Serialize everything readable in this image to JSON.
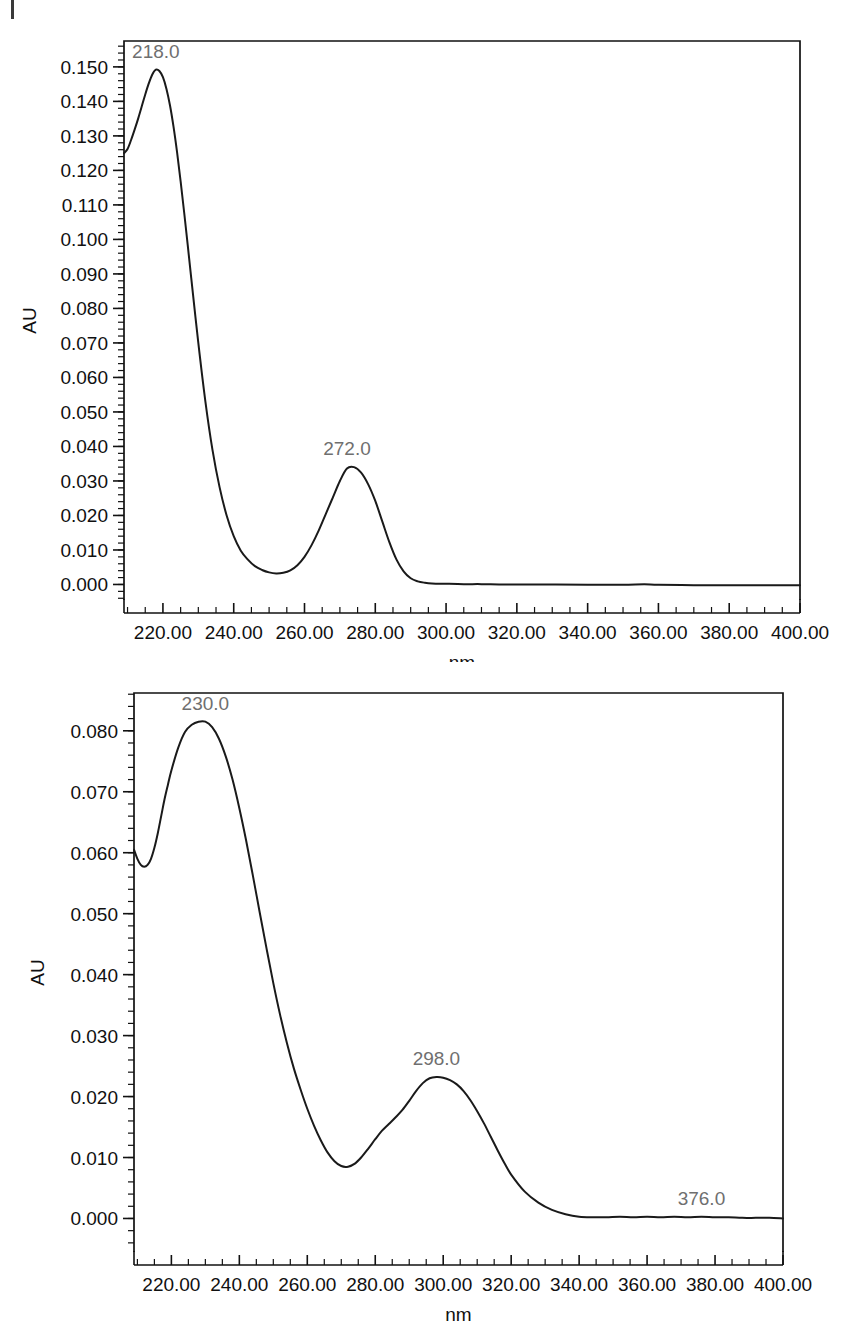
{
  "page": {
    "background_color": "#ffffff",
    "artifact_name": "scan-edge-mark",
    "width": 851,
    "height": 1324
  },
  "charts": [
    {
      "id": "uv-spectrum-top",
      "title": "",
      "xlabel": "nm",
      "ylabel": "AU",
      "trace_color": "#1a1a1a",
      "label_color": "#6f6f6f",
      "x_ticks": [
        "220.00",
        "240.00",
        "260.00",
        "280.00",
        "300.00",
        "320.00",
        "340.00",
        "360.00",
        "380.00",
        "400.00"
      ],
      "y_ticks": [
        "0.150",
        "0.140",
        "0.130",
        "0.120",
        "0.110",
        "0.100",
        "0.090",
        "0.080",
        "0.070",
        "0.060",
        "0.050",
        "0.040",
        "0.030",
        "0.020",
        "0.010",
        "0.000"
      ],
      "peaks": [
        {
          "label": "218.0",
          "nm": 218.0,
          "au": 0.1492
        },
        {
          "label": "272.0",
          "nm": 272.0,
          "au": 0.034
        }
      ]
    },
    {
      "id": "uv-spectrum-bottom",
      "title": "",
      "xlabel": "nm",
      "ylabel": "AU",
      "trace_color": "#1a1a1a",
      "label_color": "#6f6f6f",
      "x_ticks": [
        "220.00",
        "240.00",
        "260.00",
        "280.00",
        "300.00",
        "320.00",
        "340.00",
        "360.00",
        "380.00",
        "400.00"
      ],
      "y_ticks": [
        "0.080",
        "0.070",
        "0.060",
        "0.050",
        "0.040",
        "0.030",
        "0.020",
        "0.010",
        "0.000"
      ],
      "peaks": [
        {
          "label": "230.0",
          "nm": 230.0,
          "au": 0.0815
        },
        {
          "label": "298.0",
          "nm": 298.0,
          "au": 0.0232
        },
        {
          "label": "376.0",
          "nm": 376.0,
          "au": 0.0003
        }
      ]
    }
  ],
  "chart_data": [
    {
      "type": "line",
      "id": "uv-spectrum-top",
      "title": "",
      "xlabel": "nm",
      "ylabel": "AU",
      "xlim": [
        209.0,
        400.0
      ],
      "ylim": [
        -0.0045,
        0.1575
      ],
      "grid": false,
      "legend": "none",
      "x_tick_values": [
        220,
        240,
        260,
        280,
        300,
        320,
        340,
        360,
        380,
        400
      ],
      "y_tick_values": [
        0.0,
        0.01,
        0.02,
        0.03,
        0.04,
        0.05,
        0.06,
        0.07,
        0.08,
        0.09,
        0.1,
        0.11,
        0.12,
        0.13,
        0.14,
        0.15
      ],
      "annotations": [
        {
          "text": "218.0",
          "x": 218.0,
          "y": 0.1492
        },
        {
          "text": "272.0",
          "x": 272.0,
          "y": 0.034
        }
      ],
      "series": [
        {
          "name": "absorbance",
          "x": [
            209,
            210,
            211,
            212,
            213,
            214,
            215,
            216,
            217,
            218,
            219,
            220,
            221,
            222,
            223,
            224,
            225,
            226,
            227,
            228,
            230,
            232,
            234,
            236,
            238,
            240,
            242,
            244,
            246,
            248,
            250,
            252,
            254,
            256,
            258,
            260,
            262,
            264,
            266,
            268,
            270,
            272,
            274,
            276,
            278,
            280,
            282,
            284,
            286,
            288,
            290,
            292,
            294,
            296,
            300,
            305,
            310,
            315,
            320,
            330,
            340,
            350,
            356,
            360,
            370,
            380,
            390,
            400
          ],
          "y": [
            0.125,
            0.1262,
            0.1288,
            0.1318,
            0.135,
            0.1385,
            0.142,
            0.1452,
            0.1478,
            0.1492,
            0.1488,
            0.147,
            0.1436,
            0.1388,
            0.1326,
            0.1252,
            0.1168,
            0.1078,
            0.0984,
            0.0888,
            0.07,
            0.053,
            0.039,
            0.0282,
            0.02,
            0.014,
            0.0098,
            0.0072,
            0.0053,
            0.0042,
            0.0035,
            0.0032,
            0.0034,
            0.0041,
            0.0056,
            0.008,
            0.0114,
            0.0156,
            0.0204,
            0.0252,
            0.03,
            0.0336,
            0.034,
            0.0324,
            0.029,
            0.0242,
            0.0182,
            0.0122,
            0.0072,
            0.0038,
            0.0018,
            0.0009,
            0.0005,
            0.0003,
            0.0002,
            0.0001,
            0.0001,
            0.0,
            0.0,
            0.0,
            -0.0001,
            -0.0001,
            0.0001,
            -0.0001,
            -0.0002,
            -0.0002,
            -0.0002,
            -0.0002
          ]
        }
      ]
    },
    {
      "type": "line",
      "id": "uv-spectrum-bottom",
      "title": "",
      "xlabel": "nm",
      "ylabel": "AU",
      "xlim": [
        209.0,
        400.0
      ],
      "ylim": [
        -0.0055,
        0.0862
      ],
      "grid": false,
      "legend": "none",
      "x_tick_values": [
        220,
        240,
        260,
        280,
        300,
        320,
        340,
        360,
        380,
        400
      ],
      "y_tick_values": [
        0.0,
        0.01,
        0.02,
        0.03,
        0.04,
        0.05,
        0.06,
        0.07,
        0.08
      ],
      "annotations": [
        {
          "text": "230.0",
          "x": 230.0,
          "y": 0.0815
        },
        {
          "text": "298.0",
          "x": 298.0,
          "y": 0.0232
        },
        {
          "text": "376.0",
          "x": 376.0,
          "y": 0.0003
        }
      ],
      "series": [
        {
          "name": "absorbance",
          "x": [
            209,
            210,
            211,
            212,
            213,
            214,
            215,
            216,
            217,
            218,
            219,
            220,
            222,
            224,
            226,
            228,
            230,
            232,
            234,
            236,
            238,
            240,
            242,
            244,
            246,
            248,
            250,
            252,
            254,
            256,
            258,
            260,
            262,
            264,
            266,
            268,
            270,
            272,
            274,
            276,
            278,
            280,
            282,
            284,
            286,
            288,
            290,
            292,
            294,
            296,
            298,
            300,
            302,
            304,
            306,
            308,
            310,
            312,
            314,
            316,
            318,
            320,
            324,
            328,
            332,
            336,
            340,
            344,
            348,
            352,
            356,
            360,
            364,
            368,
            372,
            376,
            380,
            384,
            388,
            392,
            396,
            400
          ],
          "y": [
            0.0605,
            0.059,
            0.058,
            0.0577,
            0.058,
            0.059,
            0.0608,
            0.0632,
            0.066,
            0.0688,
            0.0712,
            0.0735,
            0.0772,
            0.0798,
            0.081,
            0.0815,
            0.0815,
            0.0806,
            0.0787,
            0.0758,
            0.072,
            0.0673,
            0.062,
            0.0562,
            0.0502,
            0.0443,
            0.0386,
            0.0334,
            0.0288,
            0.0247,
            0.0212,
            0.018,
            0.0152,
            0.0128,
            0.0108,
            0.0094,
            0.0086,
            0.0085,
            0.009,
            0.0101,
            0.0115,
            0.013,
            0.0144,
            0.0155,
            0.0166,
            0.0178,
            0.0193,
            0.0209,
            0.0222,
            0.023,
            0.0232,
            0.0231,
            0.0227,
            0.022,
            0.0209,
            0.0194,
            0.0176,
            0.0156,
            0.0134,
            0.0112,
            0.0091,
            0.0072,
            0.0044,
            0.0026,
            0.0014,
            0.0007,
            0.0003,
            0.0002,
            0.0002,
            0.0003,
            0.0002,
            0.0003,
            0.0002,
            0.0003,
            0.0002,
            0.0003,
            0.0002,
            0.0002,
            0.0001,
            0.0001,
            0.0001,
            0.0
          ]
        }
      ]
    }
  ]
}
